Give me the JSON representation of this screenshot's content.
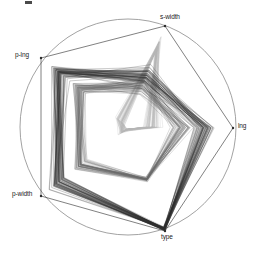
{
  "plot": {
    "type": "radviz-star-coordinates",
    "background_color": "#ffffff",
    "circle_color": "#8a8a8a",
    "line_color_dark": "#2b2b2b",
    "line_color_mid": "#6b6b6b",
    "line_color_light": "#b5b5b5",
    "label_color": "#1a1a1a",
    "center": {
      "x": 128,
      "y": 127
    },
    "radius": 108,
    "anchors": [
      {
        "name": "s-width",
        "label": "s-width",
        "angle_deg": 90,
        "x": 168,
        "y": 20,
        "label_x": 162,
        "label_y": 14,
        "anchor_px_x": 165,
        "anchor_px_y": 26
      },
      {
        "name": "lng",
        "label": "lng",
        "angle_deg": 6,
        "x": 236,
        "y": 127,
        "label_x": 238,
        "label_y": 123,
        "anchor_px_x": 233,
        "anchor_px_y": 128
      },
      {
        "name": "type",
        "label": "type",
        "angle_deg": -78,
        "x": 168,
        "y": 233,
        "label_x": 163,
        "label_y": 234,
        "anchor_px_x": 165,
        "anchor_px_y": 231
      },
      {
        "name": "p-width",
        "label": "p-width",
        "angle_deg": 210,
        "x": 40,
        "y": 196,
        "label_x": 14,
        "label_y": 191,
        "anchor_px_x": 41,
        "anchor_px_y": 196
      },
      {
        "name": "p-lng",
        "label": "p-lng",
        "angle_deg": 150,
        "x": 40,
        "y": 57,
        "label_x": 14,
        "label_y": 52,
        "anchor_px_x": 41,
        "anchor_px_y": 58
      }
    ],
    "corner_mark": {
      "visible": true,
      "label": ""
    }
  },
  "chart_data": {
    "type": "line",
    "title": "",
    "subtitle": "",
    "xlabel": "",
    "ylabel": "",
    "grid": false,
    "legend": "none",
    "axes": [
      "s-width",
      "lng",
      "type",
      "p-width",
      "p-lng"
    ],
    "n_records": 150,
    "series": [
      {
        "name": "setosa",
        "count": 50,
        "color": "#b5b5b5"
      },
      {
        "name": "versicolor",
        "count": 50,
        "color": "#6b6b6b"
      },
      {
        "name": "virginica",
        "count": 50,
        "color": "#2b2b2b"
      }
    ],
    "axis_ranges": {
      "s-width": [
        2.0,
        4.4
      ],
      "lng": [
        4.3,
        7.9
      ],
      "type": [
        0,
        2
      ],
      "p-width": [
        0.1,
        2.5
      ],
      "p-lng": [
        1.0,
        6.9
      ]
    },
    "circle": {
      "cx": 128,
      "cy": 127,
      "r": 108,
      "stroke": "#8a8a8a"
    }
  }
}
